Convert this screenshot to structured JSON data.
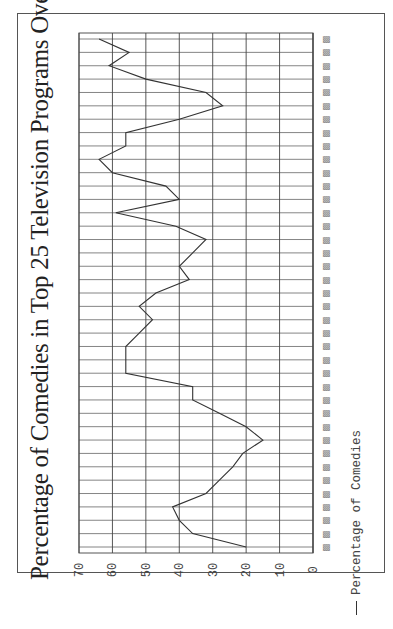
{
  "chart_data": {
    "type": "line",
    "title": "Percentage of Comedies in Top 25 Television Programs Over Time",
    "orientation": "rotated 90° counter-clockwise (value axis horizontal at bottom of image, categories along vertical)",
    "xlabel": "",
    "ylabel": "",
    "ylim": [
      0,
      70
    ],
    "yticks": [
      0,
      10,
      20,
      30,
      40,
      50,
      60,
      70
    ],
    "grid": true,
    "legend_position": "bottom",
    "category_labels_note": "category tick labels are rendered as unreadable glyph boxes",
    "categories_count": 39,
    "series": [
      {
        "name": "Percentage of Comedies",
        "values": [
          20,
          36,
          40,
          42,
          32,
          28,
          24,
          21,
          15,
          20,
          28,
          36,
          36,
          56,
          56,
          56,
          52,
          48,
          52,
          47,
          37,
          40,
          36,
          32,
          41,
          59,
          40,
          44,
          60,
          64,
          56,
          56,
          40,
          27,
          32,
          50,
          61,
          55,
          64
        ]
      }
    ]
  },
  "legend": {
    "label": "Percentage of Comedies"
  },
  "colors": {
    "line": "#333333",
    "grid": "#555555",
    "background": "#ffffff"
  }
}
